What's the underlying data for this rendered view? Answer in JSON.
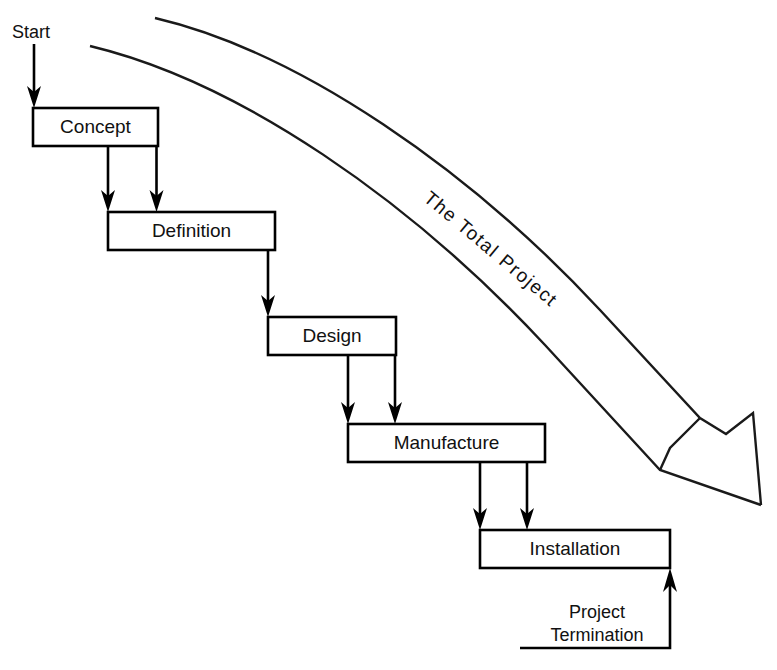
{
  "diagram": {
    "canvas": {
      "width": 777,
      "height": 670
    },
    "colors": {
      "ink": "#000000",
      "paper": "#ffffff",
      "outline": "#1a1a1a"
    },
    "start_label": "Start",
    "termination_label_line1": "Project",
    "termination_label_line2": "Termination",
    "total_arrow_label": "The  Total  Project",
    "stages": [
      {
        "id": "concept",
        "label": "Concept",
        "x": 33,
        "y": 108,
        "w": 125,
        "h": 38
      },
      {
        "id": "definition",
        "label": "Definition",
        "x": 108,
        "y": 212,
        "w": 167,
        "h": 38
      },
      {
        "id": "design",
        "label": "Design",
        "x": 268,
        "y": 317,
        "w": 128,
        "h": 38
      },
      {
        "id": "manufacture",
        "label": "Manufacture",
        "x": 348,
        "y": 424,
        "w": 197,
        "h": 38
      },
      {
        "id": "installation",
        "label": "Installation",
        "x": 480,
        "y": 530,
        "w": 190,
        "h": 38
      }
    ],
    "connector_count": 8,
    "feedback_arrow": "Project Termination returns to Installation"
  }
}
